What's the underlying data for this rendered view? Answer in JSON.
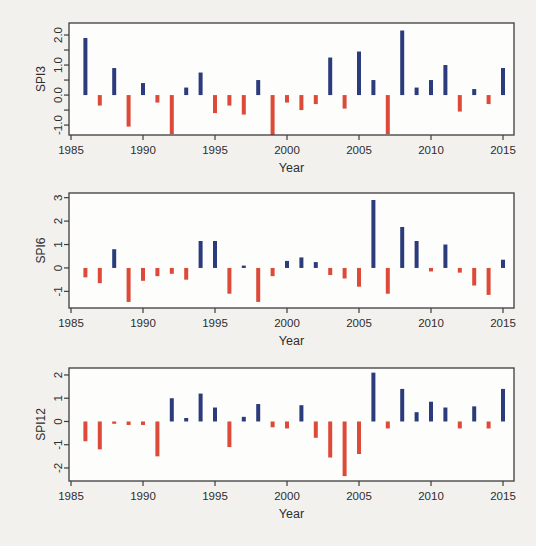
{
  "colors": {
    "background": "#f2f1ee",
    "plot_background": "#fdfdfb",
    "axis": "#3d3d3d",
    "text": "#2e2e2e",
    "positive_bar": "#2b3b7c",
    "negative_bar": "#dc4a3a"
  },
  "chart_data": [
    {
      "type": "bar",
      "ylabel": "SPI3",
      "xlabel": "Year",
      "positive_color": "#2b3b7c",
      "negative_color": "#dc4a3a",
      "ylim": [
        -1.33,
        2.4
      ],
      "x": [
        1986,
        1987,
        1988,
        1989,
        1990,
        1991,
        1992,
        1993,
        1994,
        1995,
        1996,
        1997,
        1998,
        1999,
        2000,
        2001,
        2002,
        2003,
        2004,
        2005,
        2006,
        2007,
        2008,
        2009,
        2010,
        2011,
        2012,
        2013,
        2014,
        2015
      ],
      "values": [
        1.9,
        -0.35,
        0.9,
        -1.05,
        0.4,
        -0.25,
        -1.3,
        0.25,
        0.75,
        -0.6,
        -0.35,
        -0.65,
        0.5,
        -1.35,
        -0.25,
        -0.5,
        -0.3,
        1.25,
        -0.45,
        1.45,
        0.5,
        -1.3,
        2.15,
        0.25,
        0.5,
        1.0,
        -0.55,
        0.2,
        -0.3,
        0.9
      ],
      "yticks": [
        {
          "v": 2.0,
          "label": "2.0"
        },
        {
          "v": 1.5,
          "label": ""
        },
        {
          "v": 1.0,
          "label": "1.0"
        },
        {
          "v": 0.5,
          "label": ""
        },
        {
          "v": 0.0,
          "label": "0.0"
        },
        {
          "v": -0.5,
          "label": ""
        },
        {
          "v": -1.0,
          "label": "-1.0"
        }
      ],
      "xticks": [
        {
          "v": 1985,
          "label": "1985"
        },
        {
          "v": 1990,
          "label": "1990"
        },
        {
          "v": 1995,
          "label": "1995"
        },
        {
          "v": 2000,
          "label": "2000"
        },
        {
          "v": 2005,
          "label": "2005"
        },
        {
          "v": 2010,
          "label": "2010"
        },
        {
          "v": 2015,
          "label": "2015"
        }
      ]
    },
    {
      "type": "bar",
      "ylabel": "SPI6",
      "xlabel": "Year",
      "positive_color": "#2b3b7c",
      "negative_color": "#dc4a3a",
      "ylim": [
        -1.71,
        3.2
      ],
      "x": [
        1986,
        1987,
        1988,
        1989,
        1990,
        1991,
        1992,
        1993,
        1994,
        1995,
        1996,
        1997,
        1998,
        1999,
        2000,
        2001,
        2002,
        2003,
        2004,
        2005,
        2006,
        2007,
        2008,
        2009,
        2010,
        2011,
        2012,
        2013,
        2014,
        2015
      ],
      "values": [
        -0.4,
        -0.65,
        0.8,
        -1.45,
        -0.55,
        -0.35,
        -0.25,
        -0.5,
        1.15,
        1.15,
        -1.1,
        0.1,
        -1.45,
        -0.35,
        0.3,
        0.45,
        0.25,
        -0.3,
        -0.45,
        -0.8,
        2.9,
        -1.1,
        1.75,
        1.15,
        -0.15,
        1.0,
        -0.2,
        -0.75,
        -1.15,
        0.35
      ],
      "yticks": [
        {
          "v": 3,
          "label": "3"
        },
        {
          "v": 2,
          "label": "2"
        },
        {
          "v": 1,
          "label": "1"
        },
        {
          "v": 0,
          "label": "0"
        },
        {
          "v": -1,
          "label": "-1"
        }
      ],
      "xticks": [
        {
          "v": 1985,
          "label": "1985"
        },
        {
          "v": 1990,
          "label": "1990"
        },
        {
          "v": 1995,
          "label": "1995"
        },
        {
          "v": 2000,
          "label": "2000"
        },
        {
          "v": 2005,
          "label": "2005"
        },
        {
          "v": 2010,
          "label": "2010"
        },
        {
          "v": 2015,
          "label": "2015"
        }
      ]
    },
    {
      "type": "bar",
      "ylabel": "SPI12",
      "xlabel": "Year",
      "positive_color": "#2b3b7c",
      "negative_color": "#dc4a3a",
      "ylim": [
        -2.56,
        2.3
      ],
      "x": [
        1986,
        1987,
        1988,
        1989,
        1990,
        1991,
        1992,
        1993,
        1994,
        1995,
        1996,
        1997,
        1998,
        1999,
        2000,
        2001,
        2002,
        2003,
        2004,
        2005,
        2006,
        2007,
        2008,
        2009,
        2010,
        2011,
        2012,
        2013,
        2014,
        2015
      ],
      "values": [
        -0.85,
        -1.2,
        -0.1,
        -0.15,
        -0.15,
        -1.5,
        1.0,
        0.15,
        1.2,
        0.6,
        -1.1,
        0.2,
        0.75,
        -0.25,
        -0.3,
        0.7,
        -0.7,
        -1.55,
        -2.35,
        -1.4,
        2.1,
        -0.3,
        1.4,
        0.4,
        0.85,
        0.6,
        -0.3,
        0.65,
        -0.3,
        1.4
      ],
      "yticks": [
        {
          "v": 2,
          "label": "2"
        },
        {
          "v": 1,
          "label": "1"
        },
        {
          "v": 0,
          "label": "0"
        },
        {
          "v": -1,
          "label": "-1"
        },
        {
          "v": -2,
          "label": "-2"
        }
      ],
      "xticks": [
        {
          "v": 1985,
          "label": "1985"
        },
        {
          "v": 1990,
          "label": "1990"
        },
        {
          "v": 1995,
          "label": "1995"
        },
        {
          "v": 2000,
          "label": "2000"
        },
        {
          "v": 2005,
          "label": "2005"
        },
        {
          "v": 2010,
          "label": "2010"
        },
        {
          "v": 2015,
          "label": "2015"
        }
      ]
    }
  ]
}
